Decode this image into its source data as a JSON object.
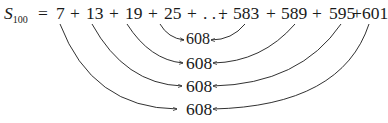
{
  "equation": {
    "lhs_symbol": "S",
    "lhs_subscript": "100",
    "equals": "=",
    "terms": [
      "7",
      "13",
      "19",
      "25",
      "583",
      "589",
      "595",
      "601"
    ],
    "operator": "+",
    "ellipsis": ". . ."
  },
  "pair_sums": [
    "608",
    "608",
    "608",
    "608"
  ],
  "pairs": [
    {
      "left": "25",
      "right": "583",
      "sum": "608"
    },
    {
      "left": "19",
      "right": "589",
      "sum": "608"
    },
    {
      "left": "13",
      "right": "595",
      "sum": "608"
    },
    {
      "left": "7",
      "right": "601",
      "sum": "608"
    }
  ],
  "colors": {
    "ink": "#1a1a1a",
    "background": "#ffffff"
  }
}
